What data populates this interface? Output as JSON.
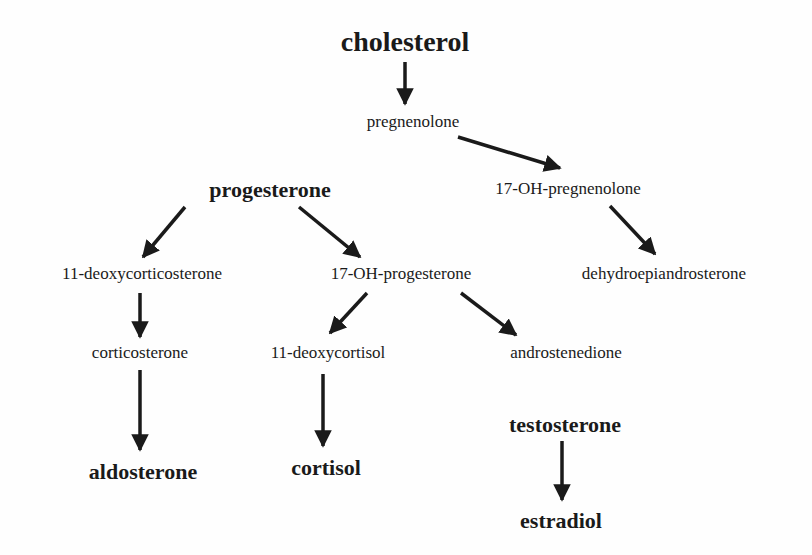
{
  "diagram": {
    "nodes": [
      {
        "id": "cholesterol",
        "label": "cholesterol",
        "major": true,
        "x": 405,
        "y": 42,
        "size": 28
      },
      {
        "id": "pregnenolone",
        "label": "pregnenolone",
        "major": false,
        "x": 413,
        "y": 122,
        "size": 17
      },
      {
        "id": "progesterone",
        "label": "progesterone",
        "major": true,
        "x": 270,
        "y": 190,
        "size": 22
      },
      {
        "id": "oh17_pregnenolone",
        "label": "17-OH-pregnenolone",
        "major": false,
        "x": 568,
        "y": 189,
        "size": 17
      },
      {
        "id": "deoxycorticosterone",
        "label": "11-deoxycorticosterone",
        "major": false,
        "x": 142,
        "y": 274,
        "size": 17
      },
      {
        "id": "oh17_progesterone",
        "label": "17-OH-progesterone",
        "major": false,
        "x": 401,
        "y": 274,
        "size": 17
      },
      {
        "id": "dhea",
        "label": "dehydroepiandrosterone",
        "major": false,
        "x": 664,
        "y": 274,
        "size": 17
      },
      {
        "id": "corticosterone",
        "label": "corticosterone",
        "major": false,
        "x": 140,
        "y": 353,
        "size": 17
      },
      {
        "id": "deoxycortisol",
        "label": "11-deoxycortisol",
        "major": false,
        "x": 328,
        "y": 353,
        "size": 17
      },
      {
        "id": "androstenedione",
        "label": "androstenedione",
        "major": false,
        "x": 566,
        "y": 353,
        "size": 17
      },
      {
        "id": "testosterone",
        "label": "testosterone",
        "major": true,
        "x": 565,
        "y": 425,
        "size": 22
      },
      {
        "id": "aldosterone",
        "label": "aldosterone",
        "major": true,
        "x": 143,
        "y": 472,
        "size": 22
      },
      {
        "id": "cortisol",
        "label": "cortisol",
        "major": true,
        "x": 326,
        "y": 468,
        "size": 22
      },
      {
        "id": "estradiol",
        "label": "estradiol",
        "major": true,
        "x": 561,
        "y": 521,
        "size": 22
      }
    ],
    "edges": [
      {
        "from": "cholesterol",
        "to": "pregnenolone",
        "x1": 405,
        "y1": 62,
        "x2": 405,
        "y2": 104
      },
      {
        "from": "pregnenolone",
        "to": "oh17_pregnenolone",
        "x1": 458,
        "y1": 137,
        "x2": 560,
        "y2": 168
      },
      {
        "from": "progesterone",
        "to": "deoxycorticosterone",
        "x1": 185,
        "y1": 207,
        "x2": 143,
        "y2": 257
      },
      {
        "from": "progesterone",
        "to": "oh17_progesterone",
        "x1": 299,
        "y1": 207,
        "x2": 360,
        "y2": 257
      },
      {
        "from": "oh17_pregnenolone",
        "to": "dhea",
        "x1": 610,
        "y1": 206,
        "x2": 655,
        "y2": 254
      },
      {
        "from": "deoxycorticosterone",
        "to": "corticosterone",
        "x1": 140,
        "y1": 293,
        "x2": 140,
        "y2": 337
      },
      {
        "from": "oh17_progesterone",
        "to": "deoxycortisol",
        "x1": 367,
        "y1": 293,
        "x2": 330,
        "y2": 333
      },
      {
        "from": "oh17_progesterone",
        "to": "androstenedione",
        "x1": 461,
        "y1": 293,
        "x2": 516,
        "y2": 335
      },
      {
        "from": "corticosterone",
        "to": "aldosterone",
        "x1": 140,
        "y1": 370,
        "x2": 140,
        "y2": 450
      },
      {
        "from": "deoxycortisol",
        "to": "cortisol",
        "x1": 323,
        "y1": 374,
        "x2": 323,
        "y2": 446
      },
      {
        "from": "testosterone",
        "to": "estradiol",
        "x1": 562,
        "y1": 441,
        "x2": 562,
        "y2": 500
      }
    ]
  }
}
